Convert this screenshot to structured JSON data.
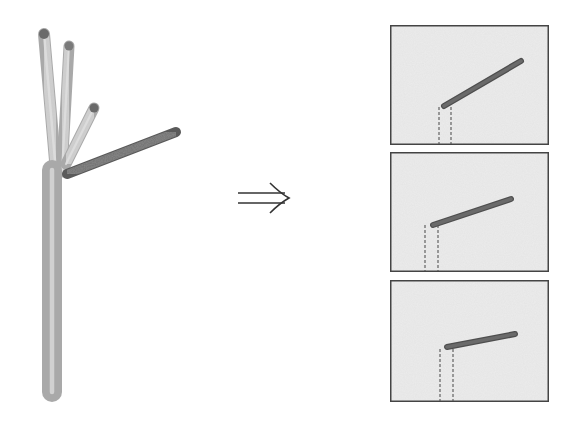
{
  "figure": {
    "description": "Branching stick structure decomposed into individual branch views",
    "arrow_symbol": "⇒",
    "colors": {
      "background": "#ffffff",
      "trunk_fill": "#cfcfcf",
      "trunk_edge": "#a9a9a9",
      "highlight_branch": "#6f6f6f",
      "panel_fill": "#ececec",
      "panel_border": "#444444",
      "dashed_line": "#555555",
      "arrow": "#333333"
    },
    "tree": {
      "trunk": {
        "x1": 52,
        "y1": 392,
        "x2": 52,
        "y2": 170,
        "width": 18
      },
      "branches": [
        {
          "name": "left-vertical-branch",
          "x1": 56,
          "y1": 172,
          "x2": 44,
          "y2": 34,
          "width": 10,
          "tip": "#6a6a6a"
        },
        {
          "name": "middle-vertical-branch",
          "x1": 62,
          "y1": 172,
          "x2": 69,
          "y2": 46,
          "width": 9,
          "tip": "#7a7a7a"
        },
        {
          "name": "short-diagonal-branch",
          "x1": 66,
          "y1": 164,
          "x2": 94,
          "y2": 108,
          "width": 9,
          "tip": "#6a6a6a"
        },
        {
          "name": "highlighted-long-branch",
          "x1": 67,
          "y1": 174,
          "x2": 176,
          "y2": 132,
          "width": 9,
          "highlight": true
        }
      ]
    },
    "panels": [
      {
        "name": "panel-1",
        "x": 390,
        "y": 25,
        "w": 159,
        "h": 120,
        "branch": {
          "x1": 444,
          "y1": 106,
          "x2": 521,
          "y2": 61
        },
        "dash_x": [
          439,
          451
        ],
        "dash_top": 107
      },
      {
        "name": "panel-2",
        "x": 390,
        "y": 152,
        "w": 159,
        "h": 120,
        "branch": {
          "x1": 433,
          "y1": 225,
          "x2": 511,
          "y2": 199
        },
        "dash_x": [
          425,
          438
        ],
        "dash_top": 225
      },
      {
        "name": "panel-3",
        "x": 390,
        "y": 280,
        "w": 159,
        "h": 122,
        "branch": {
          "x1": 447,
          "y1": 347,
          "x2": 515,
          "y2": 334
        },
        "dash_x": [
          440,
          453
        ],
        "dash_top": 349
      }
    ]
  }
}
